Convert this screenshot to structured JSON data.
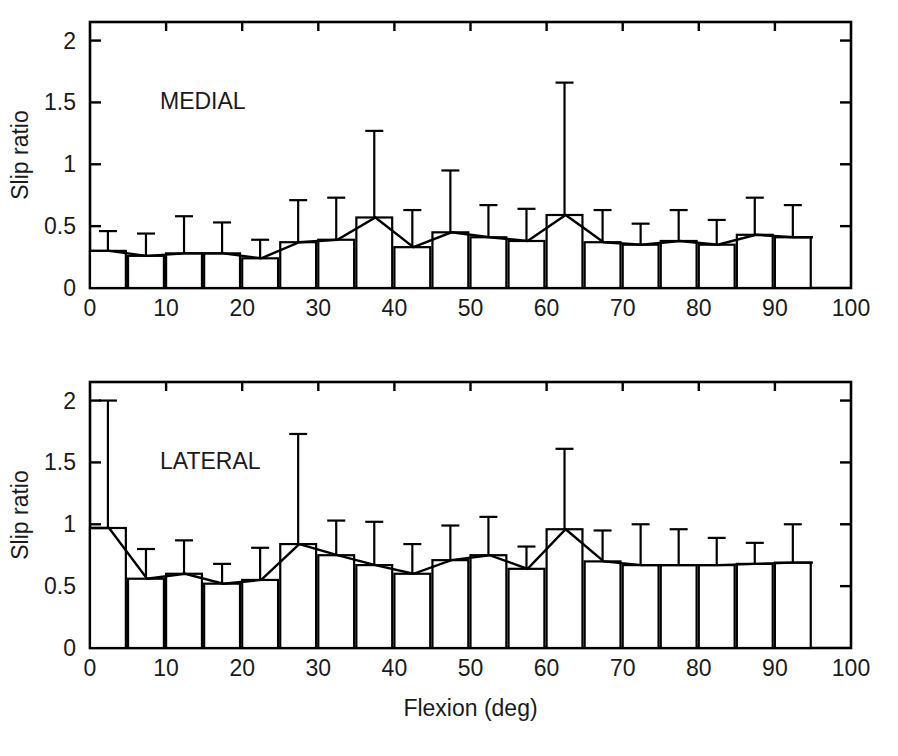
{
  "figure": {
    "background": "#ffffff",
    "ink_color": "#000000",
    "width": 898,
    "height": 756,
    "shared_xlabel": "Flexion (deg)"
  },
  "chart_data": [
    {
      "type": "bar",
      "id": "medial",
      "title": "MEDIAL",
      "panel": "top",
      "xlabel": "",
      "ylabel": "Slip ratio",
      "xlim": [
        0,
        100
      ],
      "ylim": [
        0,
        2.15
      ],
      "grid": false,
      "legend": false,
      "xticks": [
        0,
        10,
        20,
        30,
        40,
        50,
        60,
        70,
        80,
        90,
        100
      ],
      "xtick_labels": [
        "0",
        "10",
        "20",
        "30",
        "40",
        "50",
        "60",
        "70",
        "80",
        "90",
        "100"
      ],
      "yticks": [
        0,
        0.5,
        1,
        1.5,
        2
      ],
      "ytick_labels": [
        "0",
        "0.5",
        "1",
        "1.5",
        "2"
      ],
      "bar_width_deg": 5,
      "error_bars": "upper_sd_only",
      "categories": [
        2.5,
        7.5,
        12.5,
        17.5,
        22.5,
        27.5,
        32.5,
        37.5,
        42.5,
        47.5,
        52.5,
        57.5,
        62.5,
        67.5,
        72.5,
        77.5,
        82.5,
        87.5,
        92.5
      ],
      "values": [
        0.3,
        0.26,
        0.28,
        0.28,
        0.24,
        0.37,
        0.39,
        0.57,
        0.33,
        0.45,
        0.41,
        0.38,
        0.59,
        0.37,
        0.35,
        0.38,
        0.35,
        0.43,
        0.41
      ],
      "errors": [
        0.16,
        0.18,
        0.3,
        0.25,
        0.15,
        0.34,
        0.34,
        0.7,
        0.3,
        0.5,
        0.26,
        0.26,
        1.07,
        0.26,
        0.17,
        0.25,
        0.2,
        0.3,
        0.26
      ]
    },
    {
      "type": "bar",
      "id": "lateral",
      "title": "LATERAL",
      "panel": "bottom",
      "xlabel": "Flexion (deg)",
      "ylabel": "Slip ratio",
      "xlim": [
        0,
        100
      ],
      "ylim": [
        0,
        2.15
      ],
      "grid": false,
      "legend": false,
      "xticks": [
        0,
        10,
        20,
        30,
        40,
        50,
        60,
        70,
        80,
        90,
        100
      ],
      "xtick_labels": [
        "0",
        "10",
        "20",
        "30",
        "40",
        "50",
        "60",
        "70",
        "80",
        "90",
        "100"
      ],
      "yticks": [
        0,
        0.5,
        1,
        1.5,
        2
      ],
      "ytick_labels": [
        "0",
        "0.5",
        "1",
        "1.5",
        "2"
      ],
      "bar_width_deg": 5,
      "error_bars": "upper_sd_only",
      "categories": [
        2.5,
        7.5,
        12.5,
        17.5,
        22.5,
        27.5,
        32.5,
        37.5,
        42.5,
        47.5,
        52.5,
        57.5,
        62.5,
        67.5,
        72.5,
        77.5,
        82.5,
        87.5,
        92.5
      ],
      "values": [
        0.97,
        0.56,
        0.6,
        0.52,
        0.55,
        0.84,
        0.75,
        0.67,
        0.6,
        0.71,
        0.75,
        0.64,
        0.96,
        0.7,
        0.67,
        0.67,
        0.67,
        0.68,
        0.69
      ],
      "errors": [
        1.03,
        0.24,
        0.27,
        0.16,
        0.26,
        0.89,
        0.28,
        0.35,
        0.24,
        0.28,
        0.31,
        0.18,
        0.65,
        0.25,
        0.33,
        0.29,
        0.22,
        0.17,
        0.31
      ]
    }
  ]
}
